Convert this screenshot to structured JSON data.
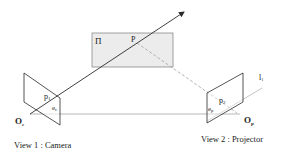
{
  "diagram": {
    "type": "epipolar-geometry",
    "plane_label": "Π",
    "point_label": "P",
    "camera": {
      "point_label": "p",
      "point_sub": "1",
      "epipole_label": "e",
      "epipole_sub": "c",
      "center_label": "O",
      "center_sub": "c",
      "caption": "View 1 : Camera"
    },
    "projector": {
      "point_label": "p",
      "point_sub": "2",
      "epipole_label": "e",
      "epipole_sub": "p",
      "center_label": "O",
      "center_sub": "p",
      "caption": "View 2 : Projector"
    },
    "epipolar_line_label": "l",
    "epipolar_line_sub": "1",
    "colors": {
      "line": "#2a2a2a",
      "plane_fill": "#ececec",
      "plane_stroke": "#8a8a8a",
      "baseline": "#9a9a9a",
      "dashed": "#a0a0a0",
      "epipolar_line": "#b5b5b5"
    }
  }
}
